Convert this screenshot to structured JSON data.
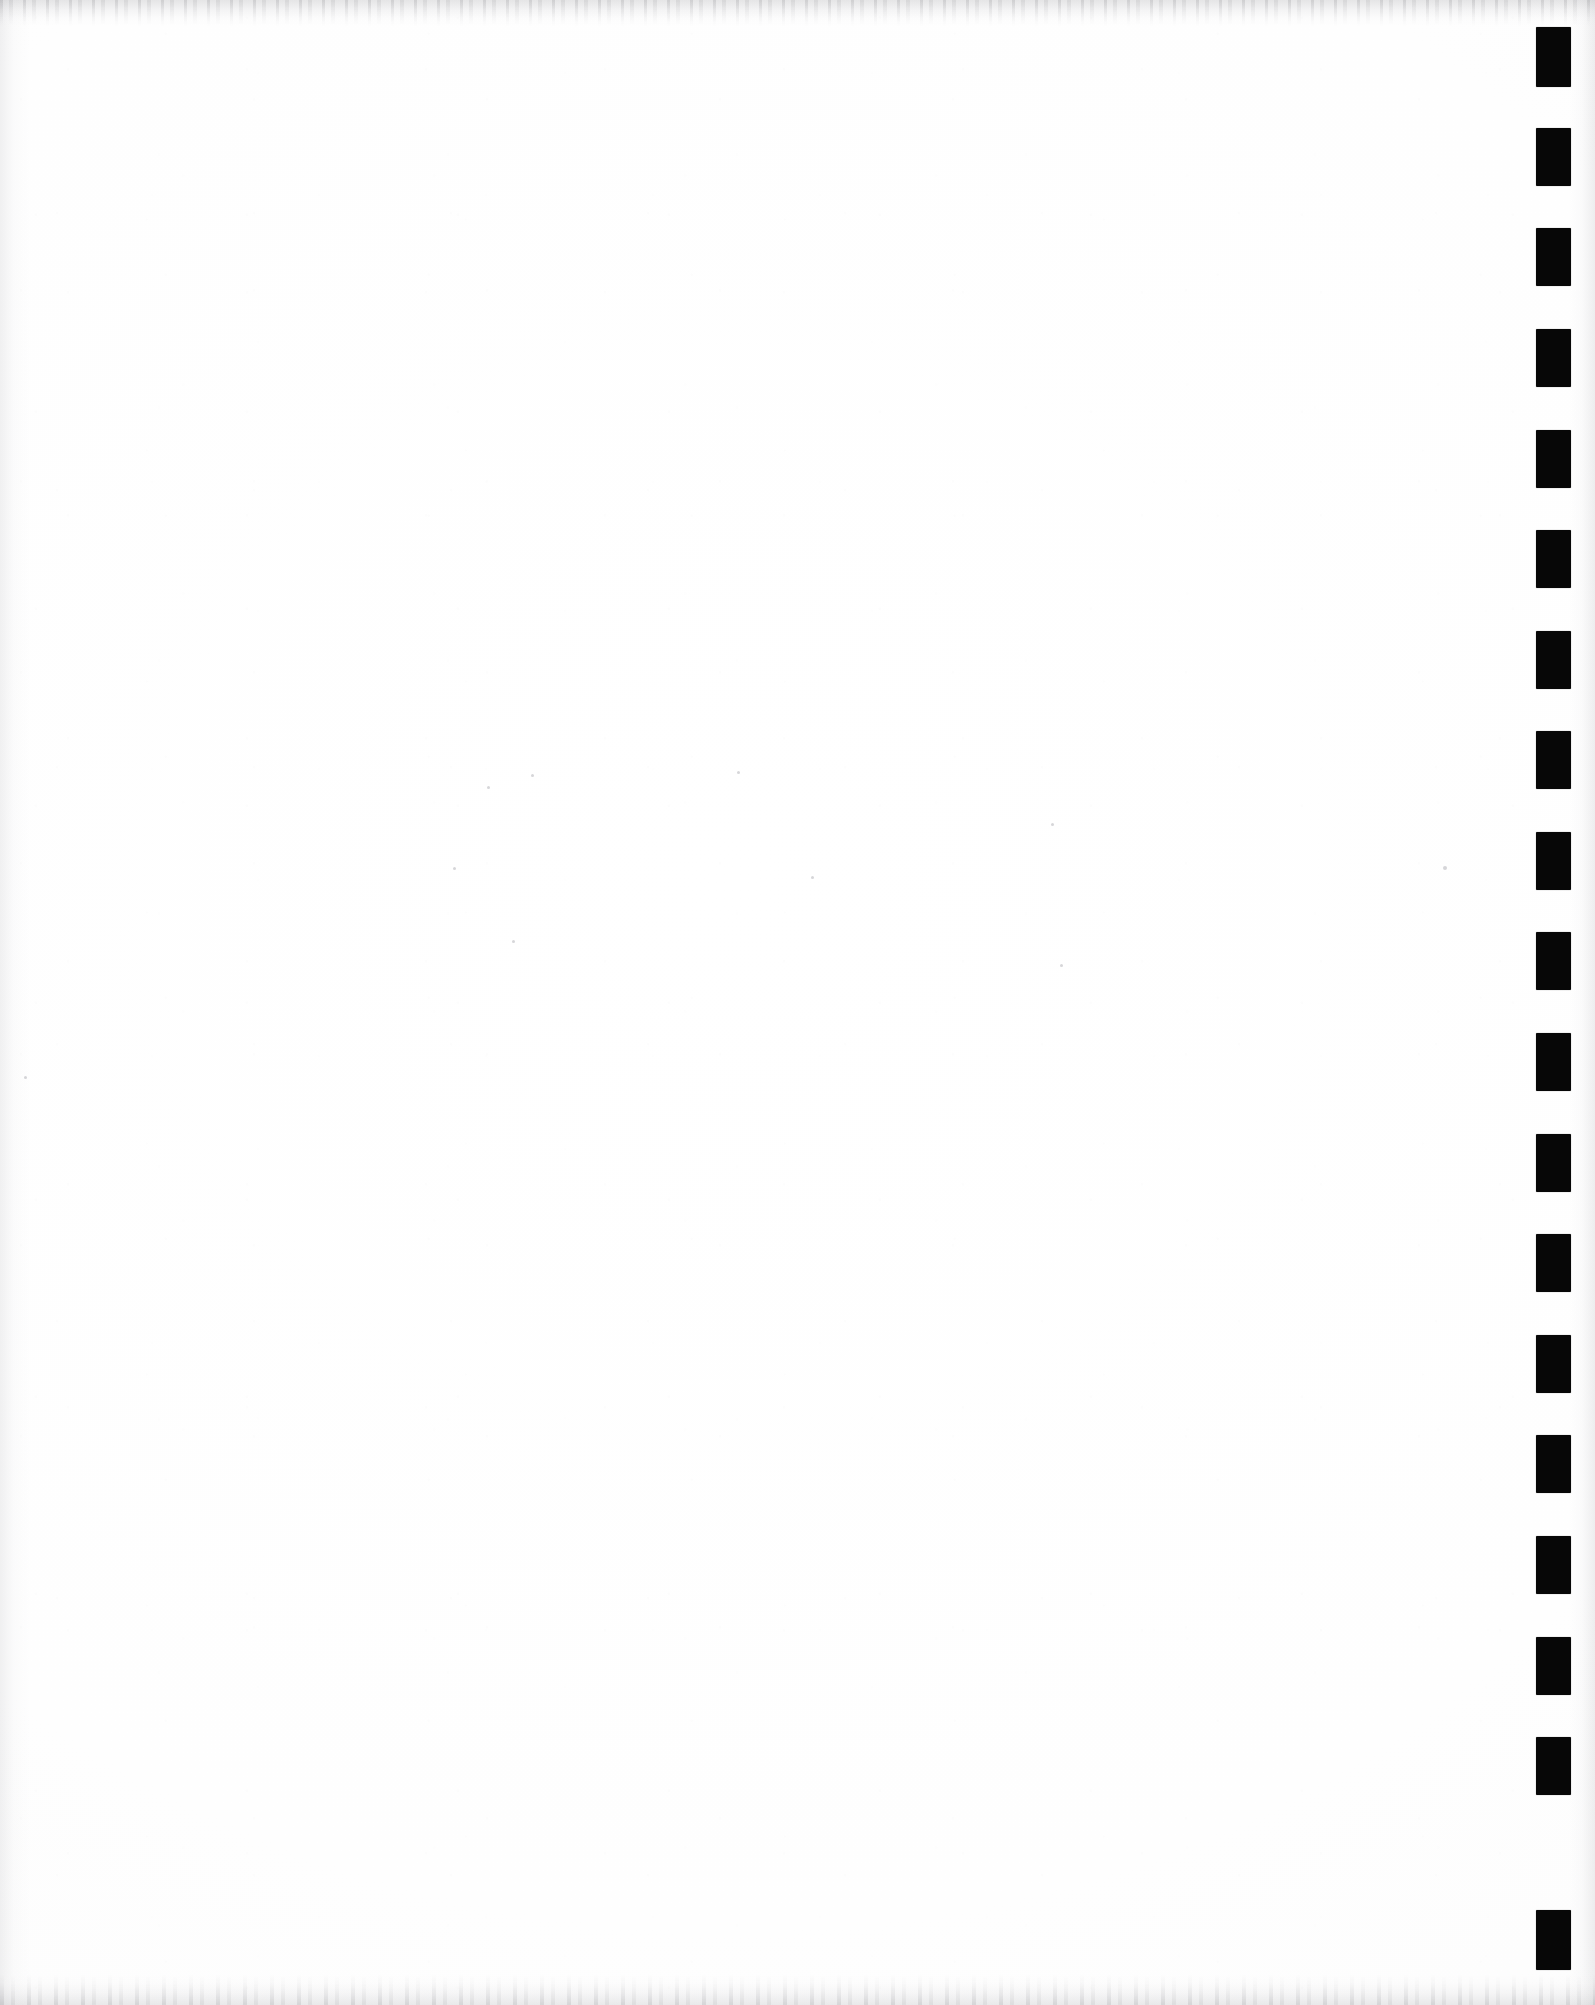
{
  "document": {
    "type": "scanned-page",
    "content_text": "",
    "page_width": 1595,
    "page_height": 2005,
    "body_is_blank": true,
    "paper_color": "#fefefe",
    "edge_shadow_color": "#a5a5aa"
  },
  "index_marks": {
    "name": "right-edge-index-marks",
    "description": "Column of solid black rectangular registration marks along the right edge",
    "count": 19,
    "color": "#070707",
    "mark_width": 35,
    "mark_height": 58,
    "column_left": 1536,
    "first_mark_top": 27,
    "pitch": 100,
    "marks": [
      {
        "index": 1,
        "top": 27,
        "height": 60
      },
      {
        "index": 2,
        "top": 128,
        "height": 58
      },
      {
        "index": 3,
        "top": 228,
        "height": 58
      },
      {
        "index": 4,
        "top": 329,
        "height": 58
      },
      {
        "index": 5,
        "top": 430,
        "height": 58
      },
      {
        "index": 6,
        "top": 530,
        "height": 58
      },
      {
        "index": 7,
        "top": 631,
        "height": 58
      },
      {
        "index": 8,
        "top": 731,
        "height": 58
      },
      {
        "index": 9,
        "top": 832,
        "height": 58
      },
      {
        "index": 10,
        "top": 932,
        "height": 58
      },
      {
        "index": 11,
        "top": 1033,
        "height": 58
      },
      {
        "index": 12,
        "top": 1134,
        "height": 58
      },
      {
        "index": 13,
        "top": 1234,
        "height": 58
      },
      {
        "index": 14,
        "top": 1335,
        "height": 58
      },
      {
        "index": 15,
        "top": 1435,
        "height": 58
      },
      {
        "index": 16,
        "top": 1536,
        "height": 58
      },
      {
        "index": 17,
        "top": 1637,
        "height": 58
      },
      {
        "index": 18,
        "top": 1737,
        "height": 58
      },
      {
        "index": 19,
        "top": 1910,
        "height": 60
      }
    ]
  },
  "scan_artifacts": {
    "specks": [
      {
        "left": 1443,
        "top": 866,
        "size": 4
      },
      {
        "left": 24,
        "top": 1076,
        "size": 3
      },
      {
        "left": 487,
        "top": 786,
        "size": 3
      },
      {
        "left": 531,
        "top": 774,
        "size": 3
      },
      {
        "left": 737,
        "top": 771,
        "size": 3
      },
      {
        "left": 1051,
        "top": 823,
        "size": 3
      },
      {
        "left": 453,
        "top": 867,
        "size": 3
      },
      {
        "left": 811,
        "top": 876,
        "size": 3
      },
      {
        "left": 1060,
        "top": 964,
        "size": 3
      },
      {
        "left": 512,
        "top": 940,
        "size": 3
      }
    ]
  }
}
